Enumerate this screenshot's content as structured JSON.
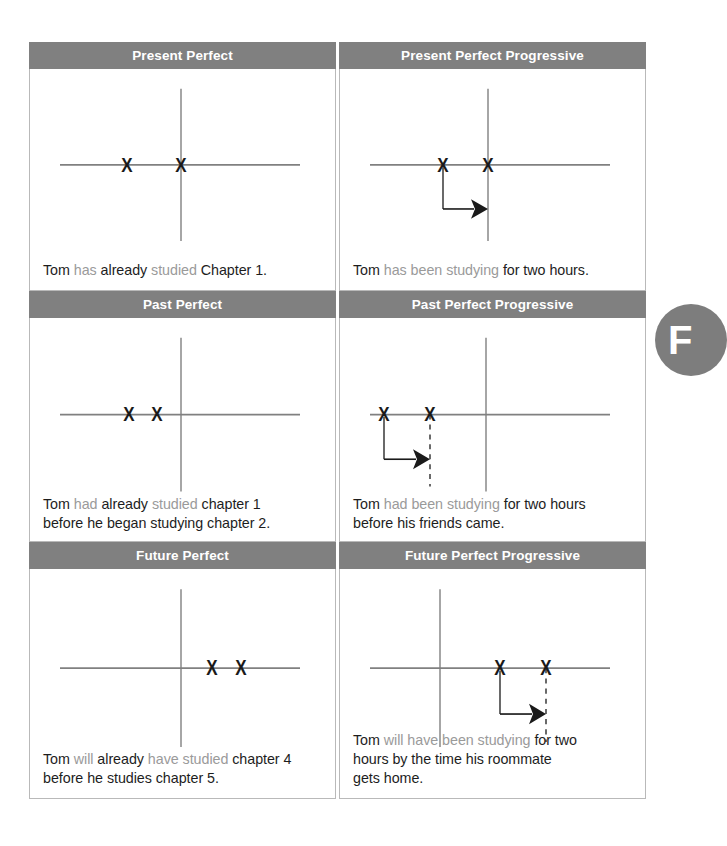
{
  "section_badge": {
    "letter": "F"
  },
  "colors": {
    "header_bg": "#808080",
    "header_text": "#ffffff",
    "cell_border": "#b9b9b9",
    "axis": "#808080",
    "mark": "#1a1a1a",
    "highlight_text": "#9a9a9a",
    "body_text": "#1d1d1d",
    "badge_bg": "#7d7d7d",
    "page_bg": "#ffffff"
  },
  "cells": [
    {
      "id": "present-perfect",
      "title": "Present Perfect",
      "sentence_parts": [
        {
          "text": "Tom ",
          "highlight": false
        },
        {
          "text": "has",
          "highlight": true
        },
        {
          "text": " already ",
          "highlight": false
        },
        {
          "text": "studied",
          "highlight": true
        },
        {
          "text": " Chapter 1.",
          "highlight": false
        }
      ],
      "sentence_plain": "Tom has already studied Chapter 1.",
      "diagram": {
        "marks": [
          {
            "x": 97,
            "label": "X"
          },
          {
            "x": 151,
            "label": "X"
          }
        ],
        "vertical_axis_x": 151,
        "arrow": null,
        "dashed_line_x": null
      }
    },
    {
      "id": "present-perfect-progressive",
      "title": "Present Perfect Progressive",
      "sentence_parts": [
        {
          "text": "Tom ",
          "highlight": false
        },
        {
          "text": "has been studying",
          "highlight": true
        },
        {
          "text": " for two hours.",
          "highlight": false
        }
      ],
      "sentence_plain": "Tom has been studying for two hours.",
      "diagram": {
        "marks": [
          {
            "x": 103,
            "label": "X"
          },
          {
            "x": 148,
            "label": "X"
          }
        ],
        "vertical_axis_x": 148,
        "arrow": {
          "from_x": 103,
          "to_x": 148,
          "drop": 36
        },
        "dashed_line_x": null
      }
    },
    {
      "id": "past-perfect",
      "title": "Past Perfect",
      "sentence_parts": [
        {
          "text": "Tom ",
          "highlight": false
        },
        {
          "text": "had",
          "highlight": true
        },
        {
          "text": " already ",
          "highlight": false
        },
        {
          "text": "studied",
          "highlight": true
        },
        {
          "text": " chapter 1",
          "highlight": false
        },
        {
          "text": "\nbefore he began studying chapter 2.",
          "highlight": false
        }
      ],
      "sentence_plain": "Tom had already studied chapter 1 before he began studying chapter 2.",
      "diagram": {
        "marks": [
          {
            "x": 99,
            "label": "X"
          },
          {
            "x": 127,
            "label": "X"
          }
        ],
        "vertical_axis_x": 151,
        "arrow": null,
        "dashed_line_x": null
      }
    },
    {
      "id": "past-perfect-progressive",
      "title": "Past Perfect Progressive",
      "sentence_parts": [
        {
          "text": "Tom ",
          "highlight": false
        },
        {
          "text": "had been studying",
          "highlight": true
        },
        {
          "text": " for two hours",
          "highlight": false
        },
        {
          "text": "\nbefore his friends came.",
          "highlight": false
        }
      ],
      "sentence_plain": "Tom had been studying for two hours before his friends came.",
      "diagram": {
        "marks": [
          {
            "x": 44,
            "label": "X"
          },
          {
            "x": 90,
            "label": "X"
          }
        ],
        "vertical_axis_x": 146,
        "arrow": {
          "from_x": 44,
          "to_x": 90,
          "drop": 36
        },
        "dashed_line_x": 90
      }
    },
    {
      "id": "future-perfect",
      "title": "Future Perfect",
      "sentence_parts": [
        {
          "text": "Tom ",
          "highlight": false
        },
        {
          "text": "will",
          "highlight": true
        },
        {
          "text": " already ",
          "highlight": false
        },
        {
          "text": "have studied",
          "highlight": true
        },
        {
          "text": " chapter 4",
          "highlight": false
        },
        {
          "text": "\nbefore he studies chapter 5.",
          "highlight": false
        }
      ],
      "sentence_plain": "Tom will already have studied chapter 4 before he studies chapter 5.",
      "diagram": {
        "marks": [
          {
            "x": 182,
            "label": "X"
          },
          {
            "x": 211,
            "label": "X"
          }
        ],
        "vertical_axis_x": 151,
        "arrow": null,
        "dashed_line_x": null
      }
    },
    {
      "id": "future-perfect-progressive",
      "title": "Future Perfect Progressive",
      "sentence_parts": [
        {
          "text": "Tom ",
          "highlight": false
        },
        {
          "text": "will have been studying",
          "highlight": true
        },
        {
          "text": " for two",
          "highlight": false
        },
        {
          "text": "\nhours by the time his roommate",
          "highlight": false
        },
        {
          "text": "\ngets home.",
          "highlight": false
        }
      ],
      "sentence_plain": "Tom will have been studying for two hours by the time his roommate gets home.",
      "diagram": {
        "marks": [
          {
            "x": 160,
            "label": "X"
          },
          {
            "x": 206,
            "label": "X"
          }
        ],
        "vertical_axis_x": 100,
        "arrow": {
          "from_x": 160,
          "to_x": 206,
          "drop": 36
        },
        "dashed_line_x": 206
      }
    }
  ]
}
